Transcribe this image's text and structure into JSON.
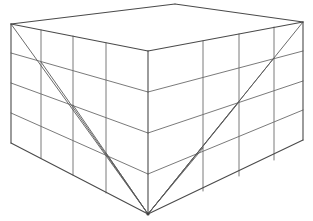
{
  "figure": {
    "title": "wireframe rectangular box",
    "type": "line-drawing",
    "canvas": {
      "width": 313,
      "height": 221,
      "background": "#ffffff"
    },
    "stroke": {
      "color": "#595959",
      "width": 1,
      "style": "solid"
    },
    "vertices": {
      "top_back_left": [
        11,
        24
      ],
      "top_back_apex": [
        175,
        4
      ],
      "top_back_right": [
        303,
        22
      ],
      "top_front_corner": [
        148,
        51
      ],
      "bottom_back_left": [
        11,
        143
      ],
      "bottom_back_right": [
        303,
        140
      ],
      "bottom_front_corner": [
        148,
        214
      ]
    },
    "left_face": {
      "name": "left-face",
      "vertical_divider_x": [
        41,
        73,
        106
      ],
      "rows": 4,
      "top_edge": [
        [
          11,
          24
        ],
        [
          148,
          51
        ]
      ],
      "bottom_edge": [
        [
          11,
          143
        ],
        [
          148,
          214
        ]
      ]
    },
    "right_face": {
      "name": "right-face",
      "vertical_divider_x": [
        203,
        239,
        274
      ],
      "rows": 4,
      "top_edge": [
        [
          148,
          51
        ],
        [
          303,
          22
        ]
      ],
      "bottom_edge": [
        [
          148,
          214
        ],
        [
          303,
          140
        ]
      ]
    },
    "top_face": {
      "name": "top-face",
      "corners": [
        [
          11,
          24
        ],
        [
          175,
          4
        ],
        [
          303,
          22
        ],
        [
          148,
          51
        ]
      ]
    },
    "braces": {
      "left_face_diagonal": "from top-back-left corner down toward the near bottom corner, crossing grid intersections",
      "right_face_diagonal": "from top-back-right corner down toward the near bottom corner, crossing grid intersections",
      "fan_lines_count": 6
    }
  }
}
